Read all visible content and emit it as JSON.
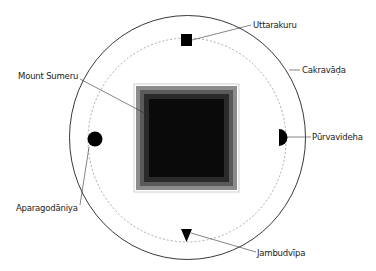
{
  "diagram": {
    "type": "cosmological-diagram",
    "colors": {
      "outer_circle": "#222222",
      "dashed_circle": "#888888",
      "continent_fill": "#000000",
      "mountain_outline": "#d8d8d8",
      "mountain_band_1": "#8c8c8c",
      "mountain_band_2": "#444444",
      "mountain_core": "#0a0a0a"
    },
    "labels": {
      "uttarakuru": "Uttarakuru",
      "cakravada": "Cakravāḍa",
      "mount_sumeru": "Mount Sumeru",
      "purvavideha": "Pūrvavideha",
      "aparagodaniya": "Aparagodāniya",
      "jambudvipa": "Jambudvīpa"
    },
    "elements": [
      {
        "name": "Cakravāḍa",
        "shape": "outer-circle",
        "position": "boundary"
      },
      {
        "name": "Mount Sumeru",
        "shape": "square",
        "position": "center"
      },
      {
        "name": "Uttarakuru",
        "shape": "square",
        "position": "north"
      },
      {
        "name": "Pūrvavideha",
        "shape": "half-circle",
        "position": "east"
      },
      {
        "name": "Jambudvīpa",
        "shape": "triangle",
        "position": "south"
      },
      {
        "name": "Aparagodāniya",
        "shape": "circle",
        "position": "west"
      }
    ]
  }
}
